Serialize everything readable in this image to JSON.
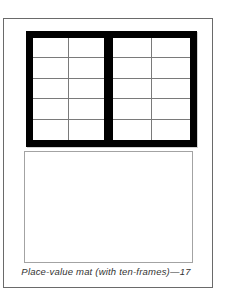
{
  "page": {
    "caption": "Place-value mat (with ten-frames)—17",
    "page_number": "17"
  },
  "ten_frames": {
    "rows": 5,
    "columns": 2,
    "frame_count": 2
  },
  "colors": {
    "frame_border": "#000000",
    "grid_line": "#7a7a7a",
    "page_border": "#6a6a6a",
    "work_area_border": "#a3a3a3",
    "background": "#ffffff",
    "caption_color": "#333333"
  }
}
